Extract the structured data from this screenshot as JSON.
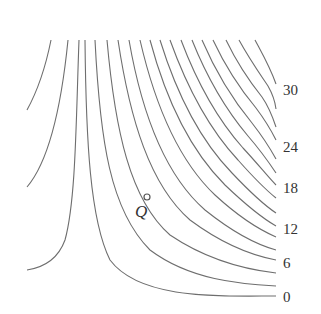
{
  "figure": {
    "type": "contour-diagram",
    "stroke_color": "#6e6e6e",
    "point": {
      "label": "Q",
      "x": 147,
      "y": 197,
      "label_x": 135,
      "label_y": 203
    },
    "level_labels": [
      {
        "text": "30",
        "x": 283,
        "y": 83
      },
      {
        "text": "24",
        "x": 283,
        "y": 140
      },
      {
        "text": "18",
        "x": 283,
        "y": 181
      },
      {
        "text": "12",
        "x": 283,
        "y": 222
      },
      {
        "text": "6",
        "x": 283,
        "y": 256
      },
      {
        "text": "0",
        "x": 283,
        "y": 290
      }
    ],
    "left_curves": [
      {
        "d": "M51,40 C46,65 38,90 27,110"
      },
      {
        "d": "M68,40 C62,100 50,160 27,187"
      },
      {
        "d": "M79,40 C76,120 76,200 65,240 C57,262 40,268 27,270"
      }
    ],
    "right_curves": [
      {
        "top_x": 85,
        "end_y": 296,
        "d": "M85,40 C86,140 90,220 110,260 C140,300 220,296 276,296"
      },
      {
        "top_x": 95,
        "end_y": 286,
        "d": "M95,40 C100,140 110,210 150,250 C190,280 240,284 276,286"
      },
      {
        "top_x": 107,
        "end_y": 273,
        "d": "M107,40 C115,130 130,200 170,235 C210,262 250,270 276,273"
      },
      {
        "top_x": 118,
        "end_y": 260,
        "d": "M118,40 C130,120 150,185 190,220 C225,246 255,256 276,260"
      },
      {
        "top_x": 129,
        "end_y": 250,
        "d": "M129,40 C142,115 165,175 205,210 C235,234 258,245 276,250"
      },
      {
        "top_x": 140,
        "end_y": 237,
        "d": "M140,40 C155,105 178,160 215,195 C240,218 260,230 276,237"
      },
      {
        "top_x": 150,
        "end_y": 226,
        "d": "M150,40 C166,100 190,150 225,185 C246,205 262,218 276,226"
      },
      {
        "top_x": 160,
        "end_y": 213,
        "d": "M160,40 C177,95 200,140 232,173 C250,192 264,205 276,213"
      },
      {
        "top_x": 170,
        "end_y": 198,
        "d": "M170,40 C188,90 210,130 238,160 C254,178 266,190 276,198"
      },
      {
        "top_x": 181,
        "end_y": 185,
        "d": "M181,40 C198,85 218,120 243,148 C258,164 268,177 276,185"
      },
      {
        "top_x": 192,
        "end_y": 173,
        "d": "M192,40 C208,80 226,110 248,136 C261,151 270,164 276,173"
      },
      {
        "top_x": 202,
        "end_y": 159,
        "d": "M202,40 C217,75 233,100 252,123 C263,137 271,150 276,159"
      },
      {
        "top_x": 213,
        "end_y": 140,
        "d": "M213,40 C227,70 241,90 256,108 C265,120 272,132 276,140"
      },
      {
        "top_x": 226,
        "end_y": 127,
        "d": "M226,40 C238,65 250,82 262,97 C269,107 273,118 276,127"
      },
      {
        "top_x": 239,
        "end_y": 109,
        "d": "M239,40 C250,60 260,74 268,86 C272,93 275,101 276,109"
      },
      {
        "top_x": 255,
        "end_y": 84,
        "d": "M255,40 C263,55 270,67 276,84"
      }
    ]
  }
}
